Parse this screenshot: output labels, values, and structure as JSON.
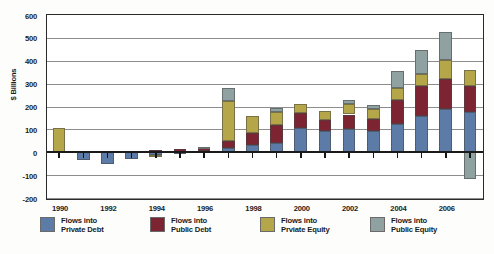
{
  "chart_data": {
    "type": "bar",
    "subtype": "stacked-bar-with-negatives",
    "title": "",
    "xlabel": "",
    "ylabel": "$ Billions",
    "ylim": [
      -200,
      600
    ],
    "yticks": [
      -200,
      -100,
      0,
      100,
      200,
      300,
      400,
      500,
      600
    ],
    "ytick_labels": [
      "-200",
      "-100",
      "0",
      "100",
      "200",
      "300",
      "400",
      "500",
      "600"
    ],
    "grid": true,
    "legend_position": "bottom",
    "categories": [
      "1990",
      "1991",
      "1992",
      "1993",
      "1994",
      "1995",
      "1996",
      "1997",
      "1998",
      "1999",
      "2000",
      "2001",
      "2002",
      "2003",
      "2004",
      "2005",
      "2006",
      "2007"
    ],
    "xtick_labels": [
      "1990",
      "1992",
      "1994",
      "1996",
      "1998",
      "2000",
      "2002",
      "2004",
      "2006"
    ],
    "series": [
      {
        "name": "Flows into Private Debt",
        "color": "#5c7ba6",
        "values": [
          0,
          -32,
          -52,
          -28,
          -12,
          -6,
          5,
          20,
          30,
          40,
          105,
          95,
          100,
          95,
          125,
          160,
          190,
          175
        ]
      },
      {
        "name": "Flows into Public Debt",
        "color": "#7d2433",
        "values": [
          0,
          0,
          0,
          0,
          12,
          14,
          14,
          30,
          55,
          80,
          65,
          45,
          65,
          50,
          105,
          130,
          130,
          115
        ]
      },
      {
        "name": "Flows into Prviate Equity",
        "color": "#b5a64a",
        "values": [
          108,
          0,
          0,
          0,
          -4,
          0,
          0,
          175,
          75,
          55,
          40,
          40,
          45,
          45,
          50,
          50,
          85,
          70
        ]
      },
      {
        "name": "Flows into Public Equity",
        "color": "#8fa1a1",
        "values": [
          0,
          0,
          0,
          0,
          0,
          0,
          5,
          55,
          0,
          20,
          0,
          0,
          20,
          15,
          75,
          105,
          120,
          -115
        ]
      }
    ],
    "totals": [
      108,
      -32,
      -52,
      -28,
      -4,
      8,
      24,
      280,
      160,
      195,
      210,
      180,
      230,
      205,
      355,
      445,
      525,
      360
    ]
  },
  "legend": {
    "items": [
      {
        "label_line1": "Flows into",
        "label_line2": "Private Debt",
        "color": "#5c7ba6",
        "swatch_name": "legend-swatch-private-debt"
      },
      {
        "label_line1": "Flows into",
        "label_line2": "Public Debt",
        "color": "#7d2433",
        "swatch_name": "legend-swatch-public-debt"
      },
      {
        "label_line1": "Flows into",
        "label_line2": "Prviate Equity",
        "color": "#b5a64a",
        "swatch_name": "legend-swatch-private-equity"
      },
      {
        "label_line1": "Flows into",
        "label_line2": "Public Equity",
        "color": "#8fa1a1",
        "swatch_name": "legend-swatch-public-equity"
      }
    ]
  }
}
